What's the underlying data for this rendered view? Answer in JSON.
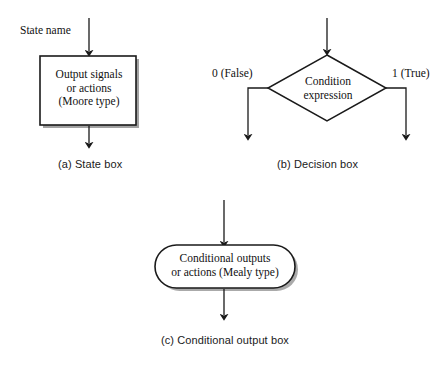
{
  "figure": {
    "background_color": "#ffffff",
    "line_color": "#1a1a1a"
  },
  "panels": [
    {
      "id": "state-box",
      "caption": "(a) State box",
      "entry_label": "State name",
      "shape": "rectangle",
      "text_lines": [
        "Output signals",
        "or actions",
        "(Moore type)"
      ]
    },
    {
      "id": "decision-box",
      "caption": "(b) Decision box",
      "shape": "diamond",
      "text_lines": [
        "Condition",
        "expression"
      ],
      "branch_false_label": "0 (False)",
      "branch_true_label": "1 (True)"
    },
    {
      "id": "conditional-output-box",
      "caption": "(c) Conditional output box",
      "shape": "stadium",
      "text_lines": [
        "Conditional outputs",
        "or actions (Mealy type)"
      ]
    }
  ],
  "state_box": {
    "caption": "(a) State box",
    "entry_label": "State name",
    "line1": "Output signals",
    "line2": "or actions",
    "line3": "(Moore type)"
  },
  "decision_box": {
    "caption": "(b) Decision box",
    "line1": "Condition",
    "line2": "expression",
    "false_label": "0 (False)",
    "true_label": "1 (True)"
  },
  "conditional_output_box": {
    "caption": "(c) Conditional output box",
    "line1": "Conditional outputs",
    "line2": "or actions (Mealy type)"
  }
}
